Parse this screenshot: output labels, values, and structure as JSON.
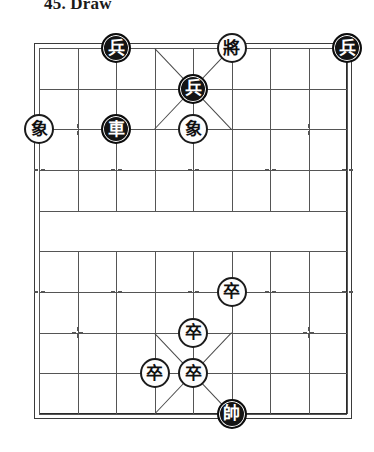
{
  "title": "45. Draw",
  "board": {
    "name": "xiangqi-board",
    "columns": 9,
    "rows": 10,
    "left": 39,
    "top": 48,
    "cell_w": 38.5,
    "cell_h": 40.666,
    "river_top_row": 4,
    "river_bottom_row": 5,
    "line_color": "#555555",
    "frame_color": "#2a2a2a",
    "background": "#ffffff"
  },
  "star_points": [
    {
      "col": 1,
      "row": 2
    },
    {
      "col": 7,
      "row": 2
    },
    {
      "col": 0,
      "row": 3
    },
    {
      "col": 2,
      "row": 3
    },
    {
      "col": 4,
      "row": 3
    },
    {
      "col": 6,
      "row": 3
    },
    {
      "col": 8,
      "row": 3
    },
    {
      "col": 0,
      "row": 6
    },
    {
      "col": 2,
      "row": 6
    },
    {
      "col": 4,
      "row": 6
    },
    {
      "col": 6,
      "row": 6
    },
    {
      "col": 8,
      "row": 6
    },
    {
      "col": 1,
      "row": 7
    },
    {
      "col": 7,
      "row": 7
    }
  ],
  "palace_diagonals": [
    {
      "col1": 3,
      "row1": 0,
      "col2": 5,
      "row2": 2
    },
    {
      "col1": 5,
      "row1": 0,
      "col2": 3,
      "row2": 2
    },
    {
      "col1": 3,
      "row1": 7,
      "col2": 5,
      "row2": 9
    },
    {
      "col1": 5,
      "row1": 7,
      "col2": 3,
      "row2": 9
    }
  ],
  "pieces": [
    {
      "label": "兵",
      "side": "black",
      "col": 2,
      "row": 0,
      "name": "piece-black-soldier-c2r0"
    },
    {
      "label": "將",
      "side": "white",
      "col": 5,
      "row": 0,
      "name": "piece-white-general-c5r0"
    },
    {
      "label": "兵",
      "side": "black",
      "col": 8,
      "row": 0,
      "name": "piece-black-soldier-c8r0"
    },
    {
      "label": "兵",
      "side": "black",
      "col": 4,
      "row": 1,
      "name": "piece-black-soldier-c4r1"
    },
    {
      "label": "象",
      "side": "white",
      "col": 0,
      "row": 2,
      "name": "piece-white-elephant-c0r2"
    },
    {
      "label": "車",
      "side": "black",
      "col": 2,
      "row": 2,
      "name": "piece-black-chariot-c2r2"
    },
    {
      "label": "象",
      "side": "white",
      "col": 4,
      "row": 2,
      "name": "piece-white-elephant-c4r2"
    },
    {
      "label": "卒",
      "side": "white",
      "col": 5,
      "row": 6,
      "name": "piece-white-pawn-c5r6"
    },
    {
      "label": "卒",
      "side": "white",
      "col": 4,
      "row": 7,
      "name": "piece-white-pawn-c4r7"
    },
    {
      "label": "卒",
      "side": "white",
      "col": 3,
      "row": 8,
      "name": "piece-white-pawn-c3r8"
    },
    {
      "label": "卒",
      "side": "white",
      "col": 4,
      "row": 8,
      "name": "piece-white-pawn-c4r8"
    },
    {
      "label": "帥",
      "side": "black",
      "col": 5,
      "row": 9,
      "name": "piece-black-marshal-c5r9"
    }
  ]
}
